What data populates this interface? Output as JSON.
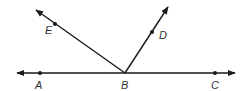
{
  "diagram": {
    "type": "geometry-rays",
    "stroke_color": "#1a1a1a",
    "line": {
      "from": [
        17,
        73
      ],
      "to": [
        235,
        73
      ],
      "arrows": "both"
    },
    "rays": [
      {
        "name": "BE",
        "from": [
          125,
          73
        ],
        "to": [
          36,
          10
        ]
      },
      {
        "name": "BD",
        "from": [
          125,
          73
        ],
        "to": [
          168,
          7
        ]
      }
    ],
    "points": [
      {
        "label": "A",
        "x": 40,
        "y": 73,
        "lx": 35,
        "ly": 89
      },
      {
        "label": "B",
        "x": 125,
        "y": 73,
        "lx": 121,
        "ly": 89
      },
      {
        "label": "C",
        "x": 215,
        "y": 73,
        "lx": 211,
        "ly": 89
      },
      {
        "label": "D",
        "x": 152,
        "y": 32,
        "lx": 159,
        "ly": 39
      },
      {
        "label": "E",
        "x": 55,
        "y": 24,
        "lx": 45,
        "ly": 34
      }
    ]
  }
}
